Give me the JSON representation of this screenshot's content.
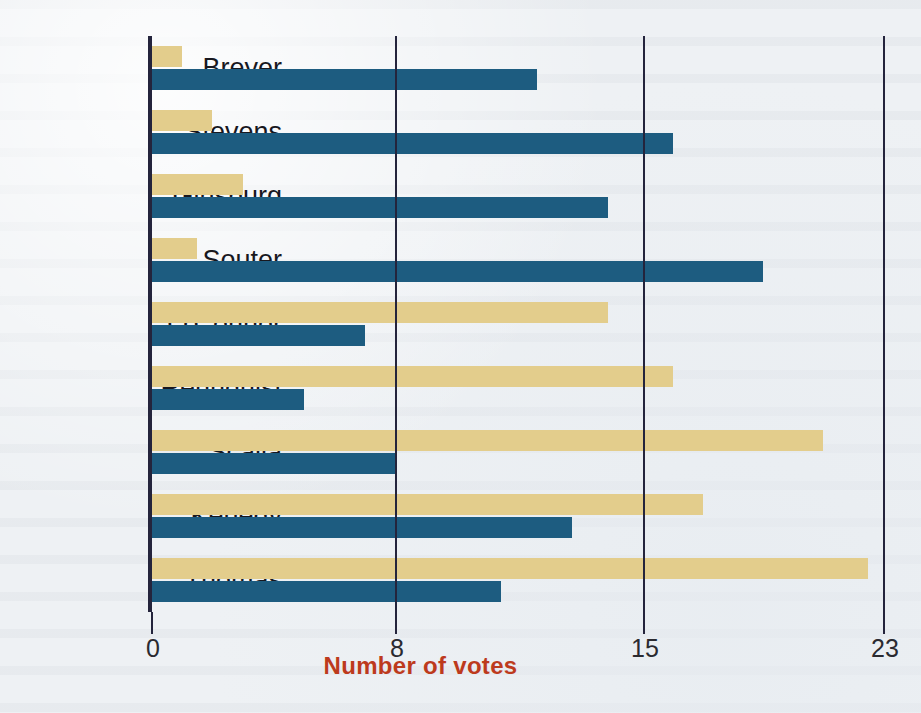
{
  "chart_data": {
    "type": "bar",
    "orientation": "horizontal",
    "title": "",
    "xlabel": "Number of votes",
    "ylabel": "",
    "xlim": [
      0,
      23
    ],
    "xticks": [
      0,
      8,
      15,
      23
    ],
    "xtick_labels": [
      "0",
      "8",
      "15",
      "23"
    ],
    "grid": true,
    "legend": "none",
    "categories": [
      "Breyer",
      "Stevens",
      "Ginsburg",
      "Souter",
      "O'Connor",
      "Rehnquist",
      "Scalia",
      "Kenedy",
      "Thomas"
    ],
    "series": [
      {
        "name": "gold",
        "color": "#e3cd8c",
        "values": [
          1,
          2,
          3,
          1.5,
          14,
          16,
          21,
          17,
          22.5
        ]
      },
      {
        "name": "blue",
        "color": "#1d5c80",
        "values": [
          12,
          16,
          14,
          19,
          7,
          5,
          8,
          13,
          11
        ]
      }
    ],
    "colors": {
      "gold": "#e3cd8c",
      "blue": "#1d5c80",
      "axis": "#24243c",
      "xlabel_color": "#bd3a1d",
      "background": "#eef1f4"
    },
    "pixel_scale": {
      "axis_x": 151,
      "tick_px": [
        151,
        395,
        643,
        883
      ]
    }
  }
}
